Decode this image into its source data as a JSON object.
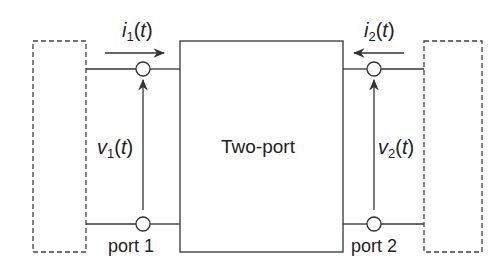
{
  "diagram": {
    "center_label": "Two-port",
    "port1": {
      "label": "port 1",
      "current": {
        "var": "i",
        "sub": "1",
        "arg": "(t)"
      },
      "voltage": {
        "var": "v",
        "sub": "1",
        "arg": "(t)"
      }
    },
    "port2": {
      "label": "port 2",
      "current": {
        "var": "i",
        "sub": "2",
        "arg": "(t)"
      },
      "voltage": {
        "var": "v",
        "sub": "2",
        "arg": "(t)"
      }
    },
    "colors": {
      "line": "#333333",
      "dash": "#444444",
      "background": "#ffffff"
    }
  }
}
